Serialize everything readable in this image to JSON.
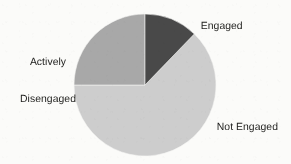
{
  "chart_data": {
    "type": "pie",
    "title": "",
    "subtitle": "",
    "xlabel": "",
    "ylabel": "",
    "grid": false,
    "legend_position": "none",
    "labels_placement": "outside-callout",
    "start_angle_deg": 0,
    "direction": "clockwise",
    "categories": [
      "Engaged",
      "Not Engaged",
      "Actively Disengaged"
    ],
    "values": [
      12,
      63,
      25
    ],
    "units": "percent",
    "slices": [
      {
        "label": "Engaged",
        "value": 12,
        "start_angle_deg": 0,
        "end_angle_deg": 44,
        "color": "#4a4a4a"
      },
      {
        "label": "Not Engaged",
        "value": 63,
        "start_angle_deg": 44,
        "end_angle_deg": 270,
        "color": "#cdcdcd"
      },
      {
        "label": "Actively Disengaged",
        "value": 25,
        "start_angle_deg": 270,
        "end_angle_deg": 360,
        "color": "#a8a8a8"
      }
    ]
  },
  "labels": {
    "engaged": "Engaged",
    "actively_disengaged_line1": "Actively",
    "actively_disengaged_line2": "Disengaged",
    "not_engaged": "Not Engaged"
  },
  "geometry": {
    "center_x": 145,
    "center_y": 85,
    "radius": 71
  },
  "colors": {
    "background": "#fbfbf9",
    "engaged": "#4a4a4a",
    "not_engaged": "#cdcdcd",
    "actively_disengaged": "#a8a8a8",
    "text": "#1d1d1b",
    "slice_edge": "#f4f4f2"
  }
}
